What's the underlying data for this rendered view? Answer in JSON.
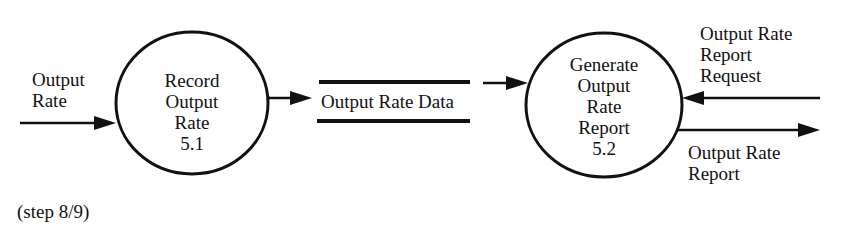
{
  "diagram": {
    "type": "data-flow-diagram",
    "processes": [
      {
        "id": "5.1",
        "lines": [
          "Record",
          "Output",
          "Rate",
          "5.1"
        ]
      },
      {
        "id": "5.2",
        "lines": [
          "Generate",
          "Output",
          "Rate",
          "Report",
          "5.2"
        ]
      }
    ],
    "data_store": {
      "label": "Output Rate Data"
    },
    "flows": [
      {
        "lines": [
          "Output",
          "Rate"
        ],
        "from": "external",
        "to": "5.1"
      },
      {
        "lines": [],
        "from": "5.1",
        "to": "Output Rate Data"
      },
      {
        "lines": [],
        "from": "Output Rate Data",
        "to": "5.2"
      },
      {
        "lines": [
          "Output Rate",
          "Report",
          "Request"
        ],
        "from": "external",
        "to": "5.2"
      },
      {
        "lines": [
          "Output Rate",
          "Report"
        ],
        "from": "5.2",
        "to": "external"
      }
    ],
    "caption": "(step 8/9)"
  }
}
